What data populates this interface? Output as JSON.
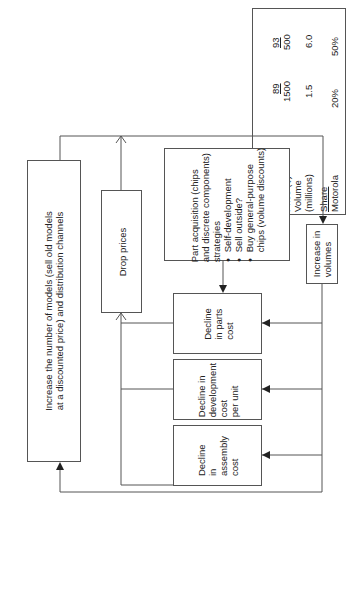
{
  "us_market": {
    "title": "US market",
    "years": [
      "89",
      "93"
    ],
    "rows": [
      {
        "label": "Price ($)",
        "values": [
          "1500",
          "500"
        ]
      },
      {
        "label": "Volume",
        "values": [
          "",
          ""
        ]
      },
      {
        "label": "(millions)",
        "values": [
          "1.5",
          "6.0"
        ]
      }
    ],
    "share_title": "Share",
    "share_rows": [
      {
        "label": "Motorola",
        "values": [
          "20%",
          "50%"
        ]
      },
      {
        "label": "Japanese",
        "values": [
          "70%",
          "35%"
        ]
      },
      {
        "label": "firms",
        "values": [
          "",
          ""
        ]
      }
    ]
  },
  "boxes": {
    "increase_models": {
      "line1": "Increase the number of models (sell old models",
      "line2": "at a discounted price) and distribution channels"
    },
    "drop_prices": {
      "label": "Drop prices"
    },
    "part_acquisition": {
      "lines": [
        "Part acquisition (chips",
        "and discrete components)",
        "strategies"
      ],
      "bullets": [
        "Self-development",
        "Sell outside?",
        "Buy general-purpose"
      ],
      "last_line": "chips (volume discounts)"
    },
    "increase_volumes": {
      "line1": "Increase in",
      "line2": "volumes"
    },
    "decline_parts": {
      "lines": [
        "Decline",
        "in parts",
        "cost"
      ]
    },
    "decline_development": {
      "lines": [
        "Decline in",
        "development",
        "cost",
        "per unit"
      ]
    },
    "decline_assembly": {
      "lines": [
        "Decline",
        "in",
        "assembly",
        "cost"
      ]
    }
  },
  "colors": {
    "line": "#555555",
    "text": "#222222",
    "background": "#ffffff"
  }
}
